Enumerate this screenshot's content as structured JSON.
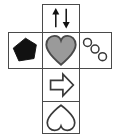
{
  "figure": {
    "kind": "cross-net-diagram",
    "shape": "plus-cross",
    "cell_count": 6,
    "background_color": "#ffffff",
    "border_color": "#4a4a4a",
    "fill_black": "#111111",
    "fill_gray": "#9a9a9a",
    "outline_color": "#3a3a3a"
  },
  "cells": [
    {
      "position": "top",
      "icon": "up-down-arrows-icon",
      "description": "two vertical arrows, left pointing up and right pointing down",
      "fill": "#111111",
      "arrows": [
        {
          "name": "up-arrow-icon",
          "direction": "up"
        },
        {
          "name": "down-arrow-icon",
          "direction": "down"
        }
      ]
    },
    {
      "position": "left",
      "icon": "filled-pentagon-icon",
      "description": "solid black irregular pentagon",
      "fill": "#111111",
      "sides": 5
    },
    {
      "position": "center",
      "icon": "filled-heart-icon",
      "description": "gray filled heart with dark outline",
      "fill": "#9a9a9a",
      "stroke": "#4a4a4a"
    },
    {
      "position": "right",
      "icon": "three-circles-icon",
      "description": "three small outlined circles arranged on a diagonal",
      "fill": "none",
      "stroke": "#3a3a3a",
      "count": 3
    },
    {
      "position": "below-center",
      "icon": "right-arrow-icon",
      "description": "outlined block arrow pointing right",
      "fill": "#ffffff",
      "stroke": "#3a3a3a",
      "direction": "right"
    },
    {
      "position": "bottom",
      "icon": "inverted-heart-outline-icon",
      "description": "outlined heart rotated 180 degrees (point upward)",
      "fill": "#ffffff",
      "stroke": "#3a3a3a"
    }
  ]
}
